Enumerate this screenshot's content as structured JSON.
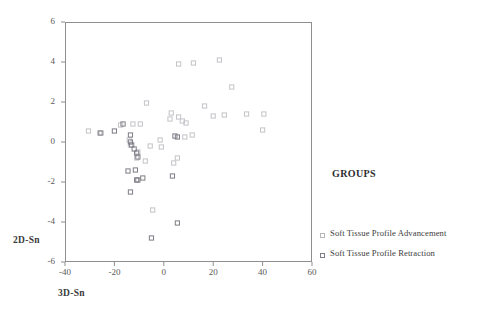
{
  "chart_data": {
    "type": "scatter",
    "title": "",
    "xlabel": "3D-Sn",
    "ylabel": "2D-Sn",
    "xlim": [
      -40,
      60
    ],
    "ylim": [
      -6,
      6
    ],
    "xticks": [
      -40,
      -20,
      0,
      20,
      40,
      60
    ],
    "yticks": [
      -6,
      -4,
      -2,
      0,
      2,
      4,
      6
    ],
    "grid": false,
    "legend_title": "GROUPS",
    "legend_position": "right",
    "series": [
      {
        "name": "Soft Tissue Profile Advancement",
        "color": "#c3c3c8",
        "marker": "square-open",
        "points": [
          [
            -30.5,
            0.55
          ],
          [
            -26.0,
            0.45
          ],
          [
            -17.5,
            0.85
          ],
          [
            -12.5,
            0.9
          ],
          [
            -9.5,
            0.9
          ],
          [
            -14.0,
            0.1
          ],
          [
            -13.5,
            -0.15
          ],
          [
            -10.5,
            -0.5
          ],
          [
            -11.0,
            -0.8
          ],
          [
            -7.5,
            -0.95
          ],
          [
            -5.5,
            -0.2
          ],
          [
            -1.5,
            0.1
          ],
          [
            -1.0,
            -0.25
          ],
          [
            -4.5,
            -3.4
          ],
          [
            -7.0,
            1.95
          ],
          [
            3.0,
            1.45
          ],
          [
            2.5,
            1.15
          ],
          [
            6.0,
            1.25
          ],
          [
            7.5,
            1.05
          ],
          [
            9.0,
            0.95
          ],
          [
            11.5,
            0.35
          ],
          [
            8.5,
            0.25
          ],
          [
            5.5,
            -0.8
          ],
          [
            4.0,
            -1.05
          ],
          [
            16.5,
            1.8
          ],
          [
            12.0,
            3.95
          ],
          [
            6.0,
            3.9
          ],
          [
            27.5,
            2.75
          ],
          [
            24.5,
            1.35
          ],
          [
            33.5,
            1.4
          ],
          [
            40.5,
            1.4
          ],
          [
            40.0,
            0.6
          ],
          [
            20.0,
            1.3
          ],
          [
            22.5,
            4.1
          ]
        ]
      },
      {
        "name": "Soft Tissue Profile Retraction",
        "color": "#7d7d86",
        "marker": "square-open",
        "points": [
          [
            -13.5,
            0.35
          ],
          [
            -13.5,
            0.0
          ],
          [
            -13.0,
            -0.15
          ],
          [
            -12.0,
            -0.35
          ],
          [
            -11.0,
            -0.55
          ],
          [
            -10.5,
            -0.75
          ],
          [
            -14.5,
            -1.45
          ],
          [
            -11.5,
            -1.4
          ],
          [
            -11.0,
            -1.9
          ],
          [
            -10.5,
            -1.9
          ],
          [
            -8.5,
            -1.8
          ],
          [
            -13.5,
            -2.5
          ],
          [
            -5.0,
            -4.8
          ],
          [
            3.5,
            -1.7
          ],
          [
            5.5,
            -4.05
          ],
          [
            4.5,
            0.3
          ],
          [
            5.5,
            0.25
          ],
          [
            -16.5,
            0.9
          ],
          [
            -20.0,
            0.55
          ],
          [
            -25.5,
            0.45
          ]
        ]
      }
    ]
  },
  "axis": {
    "y_title": "2D-Sn",
    "x_title": "3D-Sn"
  },
  "legend": {
    "title": "GROUPS",
    "items": [
      {
        "label": "Soft Tissue Profile Advancement",
        "swatch_class": "light"
      },
      {
        "label": "Soft Tissue Profile Retraction",
        "swatch_class": "dark"
      }
    ]
  }
}
